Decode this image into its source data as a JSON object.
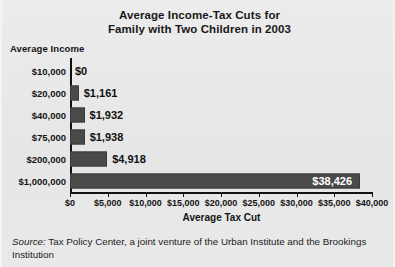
{
  "chart_data": {
    "type": "bar",
    "orientation": "horizontal",
    "title": "Average Income-Tax Cuts for Family with Two Children in 2003",
    "title_lines": [
      "Average Income-Tax Cuts for",
      "Family with Two Children in 2003"
    ],
    "xlabel": "Average Tax Cut",
    "ylabel": "Average Income",
    "categories": [
      "$10,000",
      "$20,000",
      "$40,000",
      "$75,000",
      "$200,000",
      "$1,000,000"
    ],
    "values": [
      0,
      1161,
      1932,
      1938,
      4918,
      38426
    ],
    "value_labels": [
      "$0",
      "$1,161",
      "$1,932",
      "$1,938",
      "$4,918",
      "$38,426"
    ],
    "xlim": [
      0,
      40000
    ],
    "xticks": [
      0,
      5000,
      10000,
      15000,
      20000,
      25000,
      30000,
      35000,
      40000
    ],
    "xtick_labels": [
      "$0",
      "$5,000",
      "$10,000",
      "$15,000",
      "$20,000",
      "$25,000",
      "$30,000",
      "$35,000",
      "$40,000"
    ],
    "grid": false,
    "legend": false,
    "bar_color": "#4a4a4a",
    "background_color": "#e9e9e9",
    "label_inside_color": "#ffffff"
  },
  "source": {
    "label": "Source:",
    "text": " Tax Policy Center, a joint venture of the Urban Institute and the Brookings Institution"
  }
}
